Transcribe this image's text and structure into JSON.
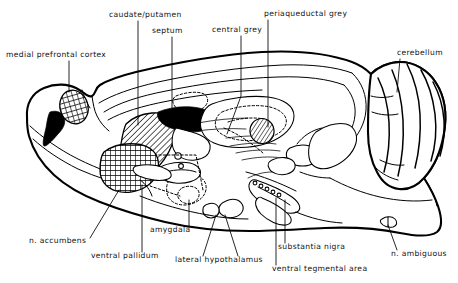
{
  "figure": {
    "type": "anatomical-diagram",
    "view": "sagittal-section",
    "background_color": "#ffffff",
    "line_color": "#000000",
    "width": 458,
    "height": 283
  },
  "labels": [
    {
      "id": "medial-prefrontal-cortex",
      "text": "medial prefrontal cortex",
      "x": 6,
      "y": 57,
      "anchor": "start",
      "leader": [
        [
          69,
          61
        ],
        [
          69,
          92
        ]
      ],
      "fill_pattern": "cross-hatch"
    },
    {
      "id": "caudate-putamen",
      "text": "caudate/putamen",
      "x": 109,
      "y": 17,
      "anchor": "start",
      "leader": [
        [
          138,
          21
        ],
        [
          138,
          125
        ]
      ],
      "fill_pattern": "diagonal-hatch"
    },
    {
      "id": "septum",
      "text": "septum",
      "x": 152,
      "y": 33,
      "anchor": "start",
      "leader": [
        [
          172,
          37
        ],
        [
          172,
          110
        ]
      ],
      "fill_pattern": "none"
    },
    {
      "id": "central-grey",
      "text": "central grey",
      "x": 212,
      "y": 32,
      "anchor": "start",
      "leader": [
        [
          241,
          36
        ],
        [
          241,
          96
        ],
        [
          227,
          134
        ]
      ],
      "fill_pattern": "none"
    },
    {
      "id": "periaqueductal-grey",
      "text": "periaqueductal grey",
      "x": 264,
      "y": 16,
      "anchor": "start",
      "leader": [
        [
          268,
          20
        ],
        [
          268,
          127
        ]
      ],
      "fill_pattern": "diagonal-hatch"
    },
    {
      "id": "cerebellum",
      "text": "cerebellum",
      "x": 397,
      "y": 55,
      "anchor": "start",
      "leader": [
        [
          400,
          59
        ],
        [
          397,
          92
        ]
      ],
      "fill_pattern": "none"
    },
    {
      "id": "n-accumbens",
      "text": "n. accumbens",
      "x": 29,
      "y": 243,
      "anchor": "start",
      "leader": [
        [
          90,
          238
        ],
        [
          119,
          190
        ]
      ],
      "fill_pattern": "cross-hatch"
    },
    {
      "id": "ventral-pallidum",
      "text": "ventral pallidum",
      "x": 91,
      "y": 258,
      "anchor": "start",
      "leader": [
        [
          142,
          252
        ],
        [
          142,
          185
        ]
      ],
      "fill_pattern": "cross-hatch"
    },
    {
      "id": "amygdala",
      "text": "amygdala",
      "x": 150,
      "y": 232,
      "anchor": "start",
      "leader": [
        [
          189,
          227
        ],
        [
          189,
          200
        ]
      ],
      "fill_pattern": "dashed-outline"
    },
    {
      "id": "lateral-hypothalamus",
      "text": "lateral hypothalamus",
      "x": 175,
      "y": 262,
      "anchor": "start",
      "leader": [
        [
          203,
          256
        ],
        [
          216,
          215
        ]
      ],
      "leader2": [
        [
          238,
          256
        ],
        [
          225,
          215
        ]
      ],
      "fill_pattern": "none"
    },
    {
      "id": "substantia-nigra",
      "text": "substantia nigra",
      "x": 278,
      "y": 249,
      "anchor": "start",
      "leader": [
        [
          285,
          243
        ],
        [
          285,
          200
        ]
      ],
      "fill_pattern": "none"
    },
    {
      "id": "ventral-tegmental-area",
      "text": "ventral tegmental area",
      "x": 272,
      "y": 271,
      "anchor": "start",
      "leader": [
        [
          276,
          265
        ],
        [
          276,
          198
        ]
      ],
      "fill_pattern": "none"
    },
    {
      "id": "n-ambiguous",
      "text": "n. ambiguous",
      "x": 391,
      "y": 256,
      "anchor": "start",
      "leader": [
        [
          397,
          250
        ],
        [
          388,
          225
        ]
      ],
      "fill_pattern": "none"
    }
  ]
}
